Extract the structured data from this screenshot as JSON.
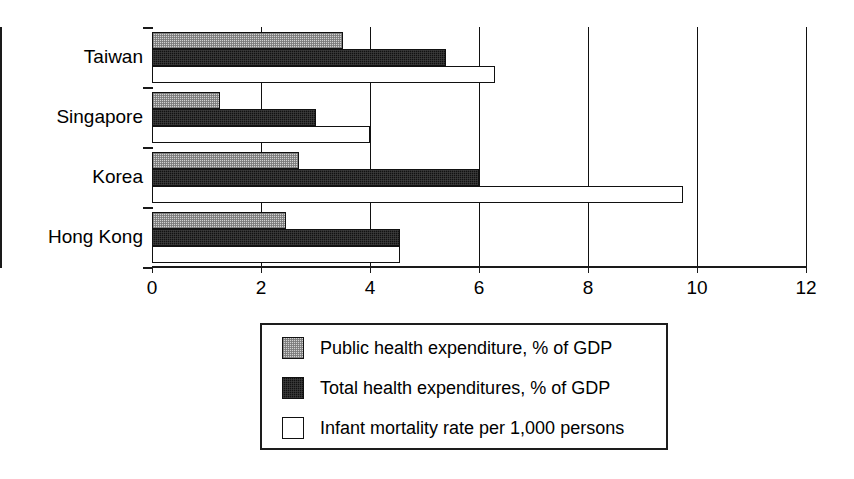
{
  "chart_data": {
    "type": "bar",
    "orientation": "horizontal",
    "title": "",
    "subtitle": "",
    "xlabel": "",
    "ylabel": "",
    "categories": [
      "Taiwan",
      "Singapore",
      "Korea",
      "Hong Kong"
    ],
    "series": [
      {
        "name": "Public health expenditure, % of GDP",
        "swatch": "light-gray-dither",
        "color": "#d2d2d2",
        "values": [
          3.5,
          1.25,
          2.7,
          2.45
        ]
      },
      {
        "name": "Total health expenditures, % of GDP",
        "swatch": "black-dither",
        "color": "#111111",
        "values": [
          5.4,
          3.0,
          6.0,
          4.55
        ]
      },
      {
        "name": "Infant mortality rate per 1,000 persons",
        "swatch": "white",
        "color": "#ffffff",
        "values": [
          6.3,
          4.0,
          9.75,
          4.55
        ]
      }
    ],
    "xlim": [
      0,
      12
    ],
    "xticks": [
      0,
      2,
      4,
      6,
      8,
      10,
      12
    ],
    "xtick_labels": [
      "0",
      "2",
      "4",
      "6",
      "8",
      "10",
      "12"
    ],
    "grid": true,
    "grid_axis": "x",
    "legend_position": "below-plot",
    "legend_entries": [
      "Public health expenditure, % of GDP",
      "Total health expenditures, % of GDP",
      "Infant mortality rate per 1,000 persons"
    ]
  },
  "axis": {
    "line_color": "#1a1a1a"
  }
}
